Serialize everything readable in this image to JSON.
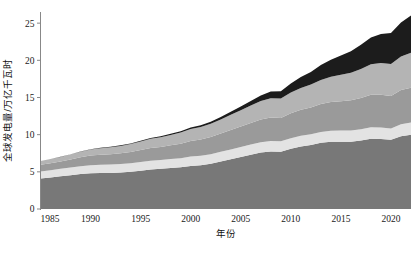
{
  "chart_data": {
    "type": "area",
    "title": "",
    "xlabel": "年份",
    "ylabel": "全球发电量/万亿千瓦时",
    "xlim": [
      1985,
      2022
    ],
    "ylim": [
      0,
      26.5
    ],
    "grid": false,
    "legend_position": "none",
    "xticks": [
      1985,
      1990,
      1995,
      2000,
      2005,
      2010,
      2015,
      2020
    ],
    "yticks": [
      0,
      5,
      10,
      15,
      20,
      25
    ],
    "x": [
      1985,
      1986,
      1987,
      1988,
      1989,
      1990,
      1991,
      1992,
      1993,
      1994,
      1995,
      1996,
      1997,
      1998,
      1999,
      2000,
      2001,
      2002,
      2003,
      2004,
      2005,
      2006,
      2007,
      2008,
      2009,
      2010,
      2011,
      2012,
      2013,
      2014,
      2015,
      2016,
      2017,
      2018,
      2019,
      2020,
      2021,
      2022
    ],
    "stack_order": [
      "band-1-bottom",
      "band-2-light",
      "band-3-mid",
      "band-4-lightmid",
      "band-5-dark"
    ],
    "series": [
      {
        "name": "band-1-bottom",
        "color": "#787878",
        "values": [
          4.1,
          4.25,
          4.4,
          4.55,
          4.7,
          4.8,
          4.85,
          4.85,
          4.9,
          5.0,
          5.15,
          5.3,
          5.4,
          5.5,
          5.6,
          5.8,
          5.9,
          6.1,
          6.4,
          6.7,
          7.0,
          7.3,
          7.6,
          7.75,
          7.7,
          8.1,
          8.4,
          8.6,
          8.9,
          9.05,
          9.05,
          9.05,
          9.2,
          9.45,
          9.4,
          9.3,
          9.8,
          10.0
        ]
      },
      {
        "name": "band-2-light",
        "color": "#e3e3e3",
        "values": [
          0.95,
          0.97,
          1.0,
          1.02,
          1.05,
          1.08,
          1.1,
          1.12,
          1.14,
          1.16,
          1.18,
          1.2,
          1.2,
          1.22,
          1.24,
          1.26,
          1.26,
          1.28,
          1.3,
          1.32,
          1.34,
          1.36,
          1.38,
          1.4,
          1.4,
          1.42,
          1.44,
          1.44,
          1.46,
          1.48,
          1.5,
          1.52,
          1.54,
          1.56,
          1.58,
          1.54,
          1.6,
          1.62
        ]
      },
      {
        "name": "band-3-mid",
        "color": "#9a9a9a",
        "values": [
          0.9,
          0.95,
          1.0,
          1.1,
          1.2,
          1.3,
          1.35,
          1.4,
          1.45,
          1.5,
          1.6,
          1.7,
          1.75,
          1.85,
          1.95,
          2.1,
          2.2,
          2.3,
          2.45,
          2.6,
          2.75,
          2.9,
          3.05,
          3.15,
          3.15,
          3.35,
          3.5,
          3.6,
          3.75,
          3.85,
          3.95,
          4.05,
          4.2,
          4.35,
          4.4,
          4.35,
          4.6,
          4.7
        ]
      },
      {
        "name": "band-4-lightmid",
        "color": "#b4b4b4",
        "values": [
          0.5,
          0.55,
          0.6,
          0.68,
          0.75,
          0.82,
          0.88,
          0.95,
          1.0,
          1.08,
          1.15,
          1.25,
          1.3,
          1.4,
          1.5,
          1.6,
          1.68,
          1.78,
          1.9,
          2.05,
          2.2,
          2.35,
          2.5,
          2.6,
          2.6,
          2.8,
          2.95,
          3.1,
          3.25,
          3.4,
          3.55,
          3.7,
          3.9,
          4.1,
          4.25,
          4.3,
          4.5,
          4.7
        ]
      },
      {
        "name": "band-5-dark",
        "color": "#1c1c1c",
        "values": [
          0.02,
          0.02,
          0.03,
          0.03,
          0.04,
          0.05,
          0.05,
          0.06,
          0.07,
          0.08,
          0.09,
          0.1,
          0.12,
          0.14,
          0.16,
          0.2,
          0.24,
          0.28,
          0.34,
          0.42,
          0.5,
          0.62,
          0.75,
          0.9,
          1.0,
          1.2,
          1.45,
          1.7,
          2.0,
          2.3,
          2.6,
          2.9,
          3.25,
          3.6,
          3.9,
          4.2,
          4.6,
          5.0
        ]
      }
    ],
    "totals": [
      6.47,
      6.74,
      7.03,
      7.38,
      7.74,
      8.05,
      8.23,
      8.38,
      8.56,
      8.82,
      9.17,
      9.55,
      9.77,
      10.11,
      10.45,
      10.96,
      11.28,
      11.74,
      12.39,
      13.09,
      13.79,
      14.53,
      15.28,
      15.8,
      15.85,
      16.87,
      17.74,
      18.44,
      19.36,
      20.08,
      20.65,
      21.22,
      22.09,
      23.06,
      23.53,
      23.69,
      25.1,
      26.02
    ]
  },
  "axes": {
    "y_title": "全球发电量/万亿千瓦时",
    "x_title": "年份",
    "y_tick_labels": [
      "0",
      "5",
      "10",
      "15",
      "20",
      "25"
    ],
    "x_tick_labels": [
      "1985",
      "1990",
      "1995",
      "2000",
      "2005",
      "2010",
      "2015",
      "2020"
    ]
  },
  "colors": {
    "band1": "#787878",
    "band2": "#e3e3e3",
    "band3": "#9a9a9a",
    "band4": "#b4b4b4",
    "band5": "#1c1c1c",
    "axis": "#888888",
    "text": "#1a1a1a",
    "background": "#ffffff"
  }
}
